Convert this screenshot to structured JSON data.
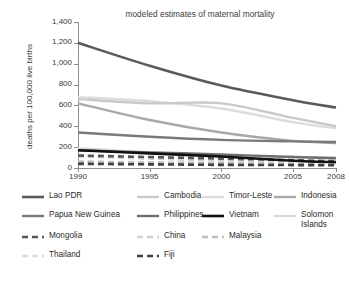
{
  "chart_data": {
    "type": "line",
    "title": "modeled estimates of maternal mortality",
    "xlabel": "",
    "ylabel": "deaths per 100,000 live births",
    "x": [
      1990,
      1995,
      2000,
      2005,
      2008
    ],
    "xlim": [
      1990,
      2008
    ],
    "ylim": [
      0,
      1400
    ],
    "yticks": [
      "0",
      "200",
      "400",
      "600",
      "800",
      "1,000",
      "1,200",
      "1,400"
    ],
    "ytick_values": [
      0,
      200,
      400,
      600,
      800,
      1000,
      1200,
      1400
    ],
    "xticks": [
      "1990",
      "1995",
      "2000",
      "2005",
      "2008"
    ],
    "grid": false,
    "legend_position": "below",
    "series": [
      {
        "name": "Lao PDR",
        "color": "#5a5a5a",
        "width": 2.6,
        "dash": "none",
        "values": [
          1200,
          980,
          790,
          650,
          580
        ]
      },
      {
        "name": "Cambodia",
        "color": "#c9c9c9",
        "width": 2.4,
        "dash": "none",
        "values": [
          660,
          620,
          620,
          480,
          400
        ]
      },
      {
        "name": "Timor-Leste",
        "color": "#dcdcdc",
        "width": 2.4,
        "dash": "none",
        "values": [
          680,
          640,
          570,
          440,
          380
        ]
      },
      {
        "name": "Indonesia",
        "color": "#a8a8a8",
        "width": 2.4,
        "dash": "none",
        "values": [
          620,
          460,
          340,
          260,
          240
        ]
      },
      {
        "name": "Papua New Guinea",
        "color": "#7a7a7a",
        "width": 2.4,
        "dash": "none",
        "values": [
          340,
          300,
          270,
          255,
          250
        ]
      },
      {
        "name": "Philippines",
        "color": "#6e6e6e",
        "width": 2.4,
        "dash": "none",
        "values": [
          170,
          150,
          130,
          105,
          94
        ]
      },
      {
        "name": "Vietnam",
        "color": "#111111",
        "width": 2.6,
        "dash": "none",
        "values": [
          170,
          140,
          110,
          70,
          56
        ]
      },
      {
        "name": "Solomon Islands",
        "color": "#d8d8d8",
        "width": 2.4,
        "dash": "none",
        "values": [
          190,
          150,
          120,
          105,
          100
        ]
      },
      {
        "name": "Mongolia",
        "color": "#555555",
        "width": 2.6,
        "dash": "dash",
        "values": [
          120,
          105,
          90,
          75,
          65
        ]
      },
      {
        "name": "China",
        "color": "#d2d2d2",
        "width": 2.6,
        "dash": "dash",
        "values": [
          110,
          90,
          70,
          50,
          38
        ]
      },
      {
        "name": "Malaysia",
        "color": "#bdbdbd",
        "width": 2.6,
        "dash": "dash",
        "values": [
          60,
          50,
          45,
          35,
          31
        ]
      },
      {
        "name": "Thailand",
        "color": "#dadada",
        "width": 2.6,
        "dash": "dash",
        "values": [
          60,
          55,
          48,
          44,
          48
        ]
      },
      {
        "name": "Fiji",
        "color": "#3f3f3f",
        "width": 2.6,
        "dash": "dash",
        "values": [
          40,
          35,
          30,
          28,
          26
        ]
      }
    ]
  },
  "legend": {
    "rows": [
      [
        {
          "name": "Lao PDR",
          "x": 0
        },
        {
          "name": "Cambodia",
          "x": 115
        },
        {
          "name": "Timor-Leste",
          "x": 180
        },
        {
          "name": "Indonesia",
          "x": 252
        }
      ],
      [
        {
          "name": "Papua New Guinea",
          "x": 0
        },
        {
          "name": "Philippines",
          "x": 115
        },
        {
          "name": "Vietnam",
          "x": 180
        },
        {
          "name": "Solomon\nIslands",
          "x": 252
        }
      ],
      [
        {
          "name": "Mongolia",
          "x": 0
        },
        {
          "name": "China",
          "x": 115
        },
        {
          "name": "Malaysia",
          "x": 180
        }
      ],
      [
        {
          "name": "Thailand",
          "x": 0
        },
        {
          "name": "Fiji",
          "x": 115
        }
      ]
    ]
  }
}
